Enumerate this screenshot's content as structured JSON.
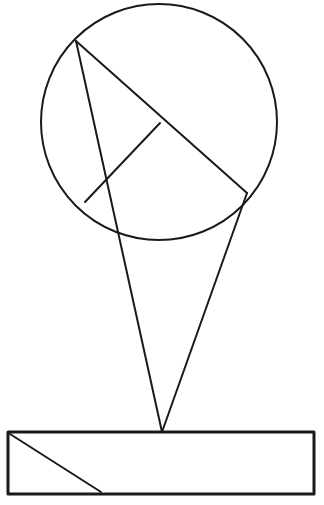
{
  "document": {
    "title": "Geometric Line Drawing",
    "background_color": "#ffffff",
    "stroke_color": "#1a1a1a",
    "canvas_width": 324,
    "canvas_height": 505,
    "description": "Line drawing of a circle with two inscribed chords meeting at the center, two straight lines descending from the circle to a common apex point, and a rectangle base containing a diagonal."
  },
  "figure": {
    "shapes": {
      "circle": {
        "name": "circle-outline",
        "center_x": 159,
        "center_y": 122,
        "radius": 118,
        "stroke_width": 2
      },
      "chord_long": {
        "name": "chord-long-diagonal",
        "x1": 76,
        "y1": 41,
        "x2": 247,
        "y2": 193,
        "stroke_width": 2
      },
      "chord_short": {
        "name": "chord-short-radius",
        "x1": 160,
        "y1": 123,
        "x2": 85,
        "y2": 202,
        "stroke_width": 2
      },
      "cone_left": {
        "name": "cone-left-side",
        "x1": 76,
        "y1": 41,
        "x2": 162,
        "y2": 432,
        "stroke_width": 2
      },
      "cone_right": {
        "name": "cone-right-side",
        "x1": 247,
        "y1": 193,
        "x2": 162,
        "y2": 432,
        "stroke_width": 2
      },
      "rectangle": {
        "name": "base-rectangle",
        "x": 8,
        "y": 432,
        "width": 306,
        "height": 62,
        "stroke_width": 3
      },
      "rect_diagonal": {
        "name": "rectangle-diagonal",
        "x1": 10,
        "y1": 434,
        "x2": 101,
        "y2": 492,
        "stroke_width": 2
      }
    },
    "vertices": {
      "apex": {
        "name": "cone-apex-point",
        "x": 162,
        "y": 432
      },
      "chord_junction": {
        "name": "chord-junction-point",
        "x": 160,
        "y": 123
      },
      "upper_left_point": {
        "name": "circle-upper-left-point",
        "x": 76,
        "y": 41
      },
      "lower_right_point": {
        "name": "circle-lower-right-point",
        "x": 247,
        "y": 193
      },
      "lower_left_point": {
        "name": "circle-lower-left-point",
        "x": 85,
        "y": 202
      }
    }
  }
}
